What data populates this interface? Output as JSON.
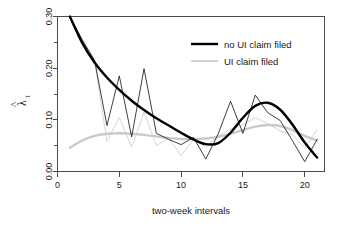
{
  "figure": {
    "background": "#ffffff",
    "axis_color": "#4d4d4d",
    "text_color": "#1a1a1a"
  },
  "axes": {
    "y_label_main": "λ",
    "y_label_hat": "^",
    "y_label_sub": "t",
    "x_label": "two-week intervals",
    "y_ticks": [
      "0.00",
      "0.10",
      "0.20",
      "0.30"
    ],
    "x_ticks": [
      "0",
      "5",
      "10",
      "15",
      "20"
    ]
  },
  "legend": {
    "items": [
      {
        "label": "no UI claim filed",
        "color": "#000000",
        "width": 2.4
      },
      {
        "label": "UI claim filed",
        "color": "#c9c9c9",
        "width": 1.6
      }
    ]
  },
  "chart_data": {
    "type": "line",
    "title": "",
    "subtitle": "",
    "xlabel": "two-week intervals",
    "ylabel": "lambda-hat_t",
    "xlim": [
      0,
      21.6
    ],
    "ylim": [
      0.0,
      0.3
    ],
    "xticks": [
      0,
      5,
      10,
      15,
      20
    ],
    "yticks": [
      0.0,
      0.1,
      0.2,
      0.3
    ],
    "yticks_minor": [
      0.05,
      0.15,
      0.25
    ],
    "grid": false,
    "legend_position": "top-right",
    "x": [
      1,
      2,
      3,
      4,
      5,
      6,
      7,
      8,
      9,
      10,
      11,
      12,
      13,
      14,
      15,
      16,
      17,
      18,
      19,
      20,
      21
    ],
    "series": [
      {
        "name": "no UI claim filed",
        "style": "raw",
        "color": "#1c1c1c",
        "values": [
          0.3,
          0.255,
          0.215,
          0.089,
          0.185,
          0.067,
          0.199,
          0.074,
          0.062,
          0.052,
          0.066,
          0.024,
          0.073,
          0.136,
          0.074,
          0.148,
          0.114,
          0.099,
          0.06,
          0.019,
          0.062
        ]
      },
      {
        "name": "no UI claim filed (smoothed)",
        "style": "smooth",
        "color": "#000000",
        "values": [
          0.3,
          0.249,
          0.211,
          0.182,
          0.158,
          0.137,
          0.119,
          0.103,
          0.089,
          0.075,
          0.062,
          0.053,
          0.055,
          0.075,
          0.104,
          0.127,
          0.133,
          0.12,
          0.091,
          0.056,
          0.027
        ]
      },
      {
        "name": "UI claim filed",
        "style": "raw",
        "color": "#cdcdcd",
        "values": [
          0.3,
          0.255,
          0.215,
          0.058,
          0.105,
          0.047,
          0.115,
          0.05,
          0.064,
          0.031,
          0.062,
          0.048,
          0.069,
          0.082,
          0.091,
          0.104,
          0.093,
          0.079,
          0.071,
          0.046,
          0.081
        ]
      },
      {
        "name": "UI claim filed (smoothed)",
        "style": "smooth",
        "color": "#c9c9c9",
        "values": [
          0.046,
          0.06,
          0.069,
          0.073,
          0.074,
          0.073,
          0.071,
          0.068,
          0.065,
          0.063,
          0.063,
          0.064,
          0.067,
          0.073,
          0.08,
          0.087,
          0.09,
          0.088,
          0.08,
          0.069,
          0.06
        ]
      }
    ]
  }
}
